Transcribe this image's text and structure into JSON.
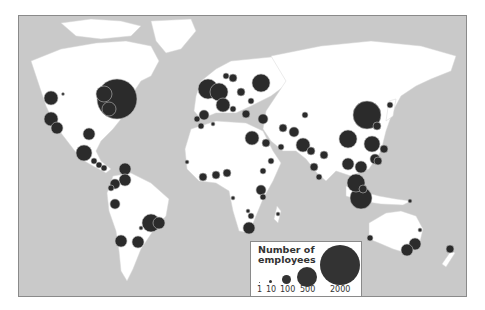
{
  "map": {
    "title": "World map of employee locations",
    "colors": {
      "ocean": "#c9c9c9",
      "land": "#ffffff",
      "marker_fill": "#2b2b2b",
      "marker_stroke": "#bdbdbd",
      "frame": "#8a8a8a"
    }
  },
  "legend": {
    "title": "Number of employees",
    "title_line1": "Number of",
    "title_line2": "employees",
    "items": [
      {
        "label": "1",
        "value": 1
      },
      {
        "label": "10",
        "value": 10
      },
      {
        "label": "100",
        "value": 100
      },
      {
        "label": "500",
        "value": 500
      },
      {
        "label": "2000",
        "value": 2000
      }
    ]
  },
  "markers": [
    {
      "region": "Northeast USA",
      "x": 116,
      "y": 98,
      "r": 20
    },
    {
      "region": "Great Lakes",
      "x": 103,
      "y": 93,
      "r": 8
    },
    {
      "region": "Eastern USA",
      "x": 108,
      "y": 108,
      "r": 7
    },
    {
      "region": "Pacific NW",
      "x": 50,
      "y": 97,
      "r": 7
    },
    {
      "region": "California N",
      "x": 50,
      "y": 118,
      "r": 7
    },
    {
      "region": "California S",
      "x": 56,
      "y": 127,
      "r": 6
    },
    {
      "region": "Montana",
      "x": 62,
      "y": 93,
      "r": 1.5
    },
    {
      "region": "Texas",
      "x": 88,
      "y": 133,
      "r": 6
    },
    {
      "region": "Mexico",
      "x": 83,
      "y": 152,
      "r": 8
    },
    {
      "region": "Central America 1",
      "x": 93,
      "y": 160,
      "r": 3
    },
    {
      "region": "Central America 2",
      "x": 98,
      "y": 164,
      "r": 3
    },
    {
      "region": "Central America 3",
      "x": 103,
      "y": 167,
      "r": 3
    },
    {
      "region": "Cuba",
      "x": 124,
      "y": 168,
      "r": 6
    },
    {
      "region": "Venezuela",
      "x": 124,
      "y": 179,
      "r": 6
    },
    {
      "region": "Colombia",
      "x": 114,
      "y": 183,
      "r": 5
    },
    {
      "region": "Ecuador",
      "x": 110,
      "y": 187,
      "r": 3
    },
    {
      "region": "Peru",
      "x": 114,
      "y": 203,
      "r": 5
    },
    {
      "region": "Brazil SE",
      "x": 150,
      "y": 222,
      "r": 9
    },
    {
      "region": "Brazil Rio",
      "x": 158,
      "y": 222,
      "r": 6
    },
    {
      "region": "Paraguay",
      "x": 140,
      "y": 227,
      "r": 2
    },
    {
      "region": "Chile",
      "x": 120,
      "y": 240,
      "r": 6
    },
    {
      "region": "Argentina",
      "x": 137,
      "y": 241,
      "r": 6
    },
    {
      "region": "UK",
      "x": 207,
      "y": 88,
      "r": 10
    },
    {
      "region": "Germany",
      "x": 218,
      "y": 91,
      "r": 9
    },
    {
      "region": "France",
      "x": 222,
      "y": 104,
      "r": 7
    },
    {
      "region": "Norway",
      "x": 225,
      "y": 75,
      "r": 3
    },
    {
      "region": "Sweden",
      "x": 232,
      "y": 77,
      "r": 4
    },
    {
      "region": "Russia Moscow",
      "x": 260,
      "y": 82,
      "r": 9
    },
    {
      "region": "Poland",
      "x": 240,
      "y": 91,
      "r": 4
    },
    {
      "region": "Ukraine",
      "x": 250,
      "y": 100,
      "r": 3
    },
    {
      "region": "Spain",
      "x": 203,
      "y": 114,
      "r": 5
    },
    {
      "region": "Portugal",
      "x": 196,
      "y": 118,
      "r": 3
    },
    {
      "region": "Italy",
      "x": 232,
      "y": 108,
      "r": 3
    },
    {
      "region": "Balkans",
      "x": 245,
      "y": 113,
      "r": 4
    },
    {
      "region": "Turkey",
      "x": 262,
      "y": 118,
      "r": 5
    },
    {
      "region": "Iran",
      "x": 282,
      "y": 127,
      "r": 4
    },
    {
      "region": "Egypt",
      "x": 251,
      "y": 137,
      "r": 7
    },
    {
      "region": "Morocco",
      "x": 200,
      "y": 125,
      "r": 3
    },
    {
      "region": "Algeria",
      "x": 212,
      "y": 123,
      "r": 2
    },
    {
      "region": "Saudi Arabia",
      "x": 265,
      "y": 142,
      "r": 4
    },
    {
      "region": "UAE",
      "x": 280,
      "y": 146,
      "r": 3
    },
    {
      "region": "Yemen",
      "x": 270,
      "y": 160,
      "r": 3
    },
    {
      "region": "Pakistan",
      "x": 293,
      "y": 131,
      "r": 5
    },
    {
      "region": "India N",
      "x": 302,
      "y": 144,
      "r": 7
    },
    {
      "region": "India Central",
      "x": 310,
      "y": 150,
      "r": 4
    },
    {
      "region": "India S",
      "x": 313,
      "y": 166,
      "r": 4
    },
    {
      "region": "Bangladesh",
      "x": 323,
      "y": 154,
      "r": 4
    },
    {
      "region": "Sri Lanka",
      "x": 318,
      "y": 176,
      "r": 3
    },
    {
      "region": "Kazakhstan",
      "x": 304,
      "y": 114,
      "r": 3
    },
    {
      "region": "Senegal",
      "x": 186,
      "y": 161,
      "r": 2
    },
    {
      "region": "Ghana",
      "x": 202,
      "y": 176,
      "r": 4
    },
    {
      "region": "Nigeria",
      "x": 215,
      "y": 174,
      "r": 4
    },
    {
      "region": "Cameroon",
      "x": 226,
      "y": 172,
      "r": 4
    },
    {
      "region": "Ethiopia",
      "x": 262,
      "y": 170,
      "r": 3
    },
    {
      "region": "Kenya",
      "x": 260,
      "y": 189,
      "r": 5
    },
    {
      "region": "Tanzania",
      "x": 262,
      "y": 196,
      "r": 3
    },
    {
      "region": "Angola",
      "x": 232,
      "y": 197,
      "r": 2
    },
    {
      "region": "Zambia",
      "x": 247,
      "y": 210,
      "r": 2
    },
    {
      "region": "Zimbabwe",
      "x": 250,
      "y": 215,
      "r": 3
    },
    {
      "region": "South Africa",
      "x": 248,
      "y": 227,
      "r": 6
    },
    {
      "region": "Madagascar",
      "x": 277,
      "y": 213,
      "r": 2
    },
    {
      "region": "China NE",
      "x": 366,
      "y": 114,
      "r": 14
    },
    {
      "region": "Korea",
      "x": 376,
      "y": 125,
      "r": 4
    },
    {
      "region": "Japan",
      "x": 389,
      "y": 104,
      "r": 3
    },
    {
      "region": "China Central",
      "x": 347,
      "y": 138,
      "r": 9
    },
    {
      "region": "China S",
      "x": 371,
      "y": 143,
      "r": 8
    },
    {
      "region": "Taiwan",
      "x": 383,
      "y": 148,
      "r": 4
    },
    {
      "region": "Hong Kong",
      "x": 374,
      "y": 158,
      "r": 5
    },
    {
      "region": "Thailand",
      "x": 347,
      "y": 163,
      "r": 6
    },
    {
      "region": "Vietnam",
      "x": 360,
      "y": 166,
      "r": 6
    },
    {
      "region": "Philippines",
      "x": 377,
      "y": 160,
      "r": 4
    },
    {
      "region": "Malaysia",
      "x": 355,
      "y": 182,
      "r": 9
    },
    {
      "region": "Indonesia",
      "x": 360,
      "y": 197,
      "r": 11
    },
    {
      "region": "Singapore",
      "x": 362,
      "y": 188,
      "r": 4
    },
    {
      "region": "Papua",
      "x": 409,
      "y": 200,
      "r": 2
    },
    {
      "region": "Perth",
      "x": 369,
      "y": 237,
      "r": 3
    },
    {
      "region": "Sydney",
      "x": 414,
      "y": 243,
      "r": 6
    },
    {
      "region": "Melbourne",
      "x": 406,
      "y": 249,
      "r": 6
    },
    {
      "region": "Brisbane",
      "x": 419,
      "y": 229,
      "r": 2
    },
    {
      "region": "New Zealand",
      "x": 449,
      "y": 248,
      "r": 4
    }
  ]
}
